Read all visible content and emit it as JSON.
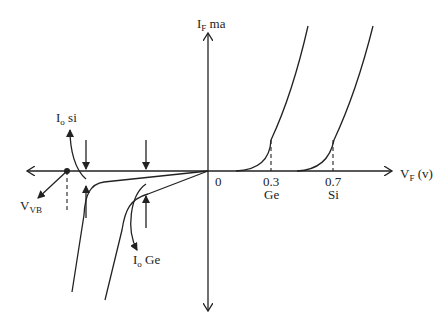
{
  "diagram": {
    "type": "diode V-I characteristics",
    "y_axis": {
      "label_main": "I",
      "label_sub": "F",
      "label_unit": " ma"
    },
    "x_axis": {
      "label_main": "V",
      "label_sub": "F",
      "label_unit": " (v)"
    },
    "origin_label": "0",
    "ticks": [
      {
        "value": "0.3",
        "material": "Ge"
      },
      {
        "value": "0.7",
        "material": "Si"
      }
    ],
    "annotations": {
      "io_si": {
        "main": "I",
        "sub": "o",
        "rest": " si"
      },
      "io_ge": {
        "main": "I",
        "sub": "o",
        "rest": " Ge"
      },
      "vvb": {
        "main": "V",
        "sub": "VB"
      }
    }
  }
}
